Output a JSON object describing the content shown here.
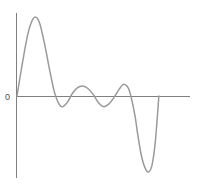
{
  "figure": {
    "background_color": "#ffffff",
    "axis_color": "#808080",
    "curve_color": "#9a9a9a"
  },
  "labels": {
    "origin_tick": "0"
  },
  "chart_data": {
    "type": "line",
    "title": "",
    "subtitle": "",
    "xlabel": "",
    "ylabel": "",
    "grid": false,
    "legend": null,
    "legend_position": "none",
    "axes": {
      "x_axis": {
        "y_value": 0,
        "pixel_y": 96,
        "pixel_x_start": 16,
        "pixel_x_end": 190,
        "ticks": [],
        "tick_labels": []
      },
      "y_axis": {
        "x_value": 0,
        "pixel_x": 16,
        "pixel_y_start": 13,
        "pixel_y_end": 178,
        "ticks": [
          0
        ],
        "tick_labels": [
          "0"
        ]
      }
    },
    "xlim": [
      0,
      1
    ],
    "ylim": [
      -1.05,
      1.05
    ],
    "series": [
      {
        "name": "waveform",
        "color": "#9a9a9a",
        "x": [
          0.0,
          0.03,
          0.06,
          0.082,
          0.105,
          0.13,
          0.16,
          0.19,
          0.22,
          0.255,
          0.29,
          0.32,
          0.35,
          0.38,
          0.41,
          0.44,
          0.47,
          0.5,
          0.53,
          0.56,
          0.59,
          0.62,
          0.65,
          0.68,
          0.7,
          0.72,
          0.74,
          0.76,
          0.78,
          0.8,
          0.82
        ],
        "y": [
          0.0,
          0.38,
          0.72,
          0.88,
          0.95,
          0.88,
          0.62,
          0.3,
          0.02,
          -0.13,
          -0.08,
          0.03,
          0.1,
          0.12,
          0.09,
          0.02,
          -0.08,
          -0.13,
          -0.1,
          -0.02,
          0.08,
          0.14,
          0.06,
          -0.22,
          -0.5,
          -0.74,
          -0.88,
          -0.93,
          -0.85,
          -0.55,
          0.0
        ],
        "key_points": [
          {
            "label": "start-at-origin",
            "x": 0.0,
            "y": 0.0,
            "pixel": [
              17,
              96
            ]
          },
          {
            "label": "primary-peak",
            "x": 0.105,
            "y": 0.95,
            "pixel": [
              30,
              17
            ]
          },
          {
            "label": "first-zero-crossing",
            "x": 0.222,
            "y": 0.0,
            "pixel": [
              46,
              96
            ]
          },
          {
            "label": "first-trough",
            "x": 0.258,
            "y": -0.14,
            "pixel": [
              50,
              108
            ]
          },
          {
            "label": "second-peak",
            "x": 0.382,
            "y": 0.13,
            "pixel": [
              63,
              85
            ]
          },
          {
            "label": "second-trough",
            "x": 0.54,
            "y": -0.13,
            "pixel": [
              80,
              108
            ]
          },
          {
            "label": "third-peak",
            "x": 0.62,
            "y": 0.16,
            "pixel": [
              93,
              81
            ]
          },
          {
            "label": "deep-negative-lobe",
            "x": 0.765,
            "y": -0.93,
            "pixel": [
              113,
              172
            ]
          },
          {
            "label": "end-return-to-zero",
            "x": 0.82,
            "y": 0.0,
            "pixel": [
              127,
              96
            ]
          }
        ]
      }
    ]
  }
}
